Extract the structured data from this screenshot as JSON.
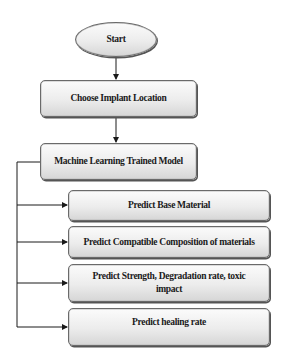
{
  "diagram": {
    "type": "flowchart",
    "start": {
      "label": "Start"
    },
    "steps": [
      {
        "label": "Choose Implant Location"
      },
      {
        "label": "Machine Learning Trained Model"
      }
    ],
    "outputs": [
      {
        "label": "Predict Base Material"
      },
      {
        "label": "Predict Compatible Composition of materials"
      },
      {
        "label": "Predict Strength, Degradation rate, toxic impact"
      },
      {
        "label": "Predict healing rate"
      }
    ],
    "colors": {
      "node_fill_top": "#fbfbfb",
      "node_fill_bottom": "#d6d6d6",
      "node_border": "#6a6a6a",
      "connector": "#1a1a1a"
    }
  }
}
